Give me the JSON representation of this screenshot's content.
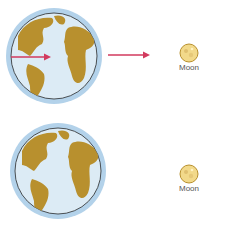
{
  "panels": [
    {
      "id": "top",
      "moon_label": "Moon",
      "has_arrows": true
    },
    {
      "id": "bottom",
      "moon_label": "Moon",
      "has_arrows": false
    }
  ],
  "colors": {
    "ocean": "#dcebf5",
    "land": "#b8902e",
    "halo": "#a9cbe6",
    "outline": "#2a2a2a",
    "arrow": "#d23a5e",
    "moon_fill": "#f2d98a",
    "moon_edge": "#b8902e",
    "label": "#555555"
  }
}
